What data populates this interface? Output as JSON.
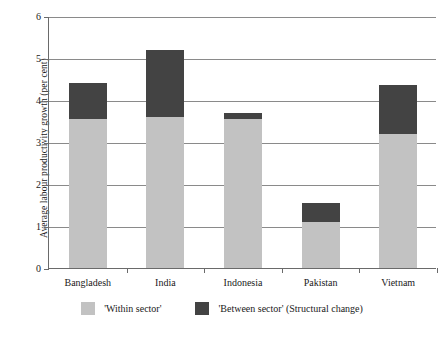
{
  "chart_data": {
    "type": "bar",
    "stacked": true,
    "title": "",
    "xlabel": "",
    "ylabel": "Average labour productivity growth (per cent)",
    "categories": [
      "Bangladesh",
      "India",
      "Indonesia",
      "Pakistan",
      "Vietnam"
    ],
    "series": [
      {
        "name": "'Within sector'",
        "color": "#c2c2c2",
        "values": [
          3.55,
          3.6,
          3.55,
          1.1,
          3.2
        ]
      },
      {
        "name": "'Between sector' (Structural change)",
        "color": "#434343",
        "values": [
          0.85,
          1.6,
          0.15,
          0.45,
          1.15
        ]
      }
    ],
    "totals": [
      4.4,
      5.2,
      3.7,
      1.55,
      4.35
    ],
    "ylim": [
      0,
      6
    ],
    "yticks": [
      0,
      1,
      2,
      3,
      4,
      5,
      6
    ],
    "ytick_labels": [
      "0",
      "1",
      "2",
      "3",
      "4",
      "5",
      "6"
    ],
    "grid": true,
    "grid_axis": "y",
    "legend_position": "bottom"
  },
  "legend": {
    "items": [
      {
        "label": "'Within sector'",
        "color": "#c2c2c2",
        "swatch_name": "legend-swatch-within-sector"
      },
      {
        "label": "'Between sector' (Structural change)",
        "color": "#434343",
        "swatch_name": "legend-swatch-between-sector"
      }
    ]
  },
  "axes": {
    "y_title": "Average labour productivity growth (per cent)",
    "y_tick_labels": [
      "6",
      "5",
      "4",
      "3",
      "2",
      "1",
      "0"
    ],
    "x_tick_labels": [
      "Bangladesh",
      "India",
      "Indonesia",
      "Pakistan",
      "Vietnam"
    ]
  }
}
